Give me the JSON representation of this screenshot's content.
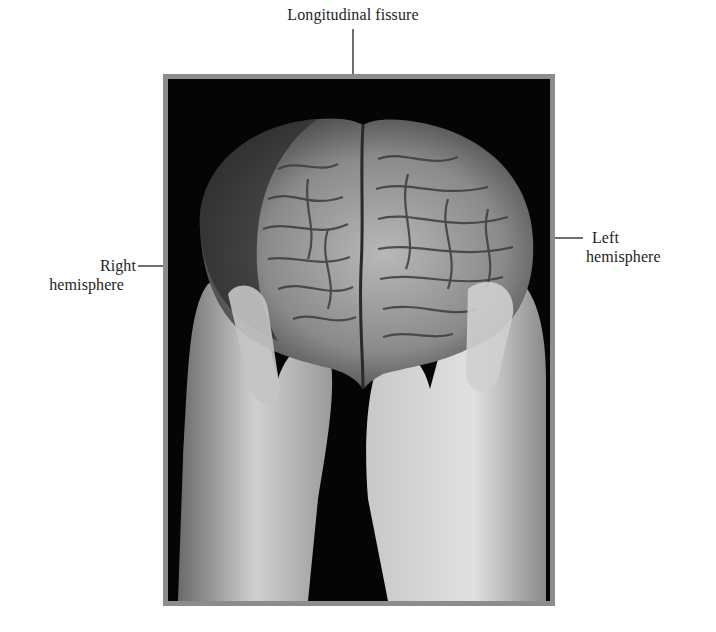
{
  "figure": {
    "labels": {
      "top": "Longitudinal fissure",
      "left_line1": "Right",
      "left_line2": "hemisphere",
      "right_line1": "Left",
      "right_line2": "hemisphere"
    },
    "photo": {
      "subject": "Human brain held in two gloved hands, viewed from above/front",
      "background_color": "#050505",
      "frame_color": "#8c8c8c"
    }
  }
}
